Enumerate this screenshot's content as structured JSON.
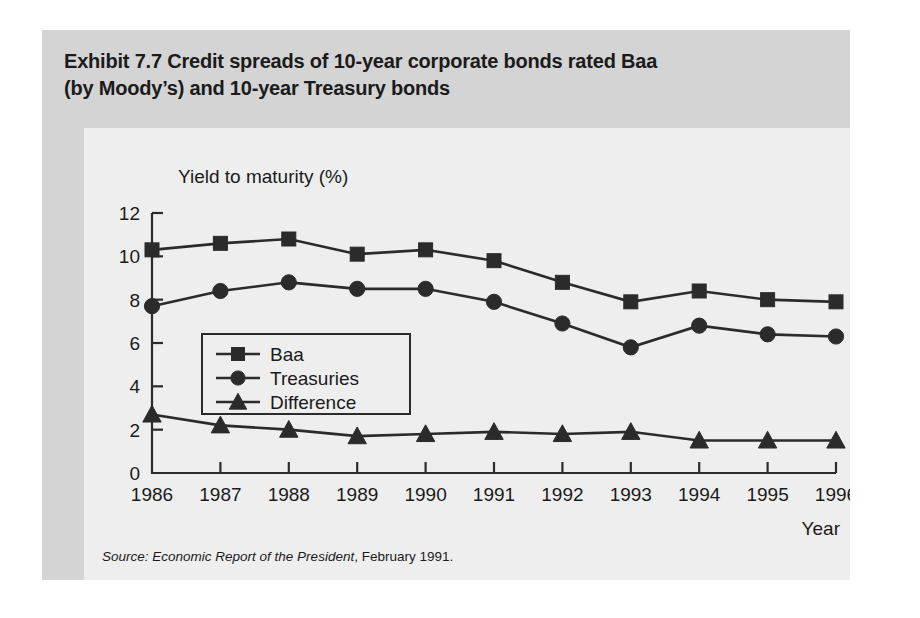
{
  "figure": {
    "title_line1": "Exhibit 7.7  Credit spreads of 10-year corporate bonds rated Baa",
    "title_line2": "(by Moody’s) and 10-year Treasury bonds",
    "source_prefix": "Source",
    "source_colon": ": ",
    "source_italic": "Economic Report of the President",
    "source_rest": ", February 1991.",
    "panel_color": "#eeeeee",
    "figure_color": "#d4d4d4",
    "ink_color": "#2b2b2b"
  },
  "chart_data": {
    "type": "line",
    "title": "Exhibit 7.7  Credit spreads of 10-year corporate bonds rated Baa (by Moody’s) and 10-year Treasury bonds",
    "xlabel": "Year",
    "ylabel": "Yield to maturity (%)",
    "categories": [
      "1986",
      "1987",
      "1988",
      "1989",
      "1990",
      "1991",
      "1992",
      "1993",
      "1994",
      "1995",
      "1996"
    ],
    "xtick_labels": [
      "1986",
      "1987",
      "1988",
      "1989",
      "1990",
      "1991",
      "1992",
      "1993",
      "1994",
      "1995",
      "1996"
    ],
    "ytick_labels": [
      "0",
      "2",
      "4",
      "6",
      "8",
      "10",
      "12"
    ],
    "ytick_values": [
      0,
      2,
      4,
      6,
      8,
      10,
      12
    ],
    "ylim": [
      0,
      12
    ],
    "grid": false,
    "legend_position": "inside-left",
    "series": [
      {
        "name": "Baa",
        "marker": "square",
        "values": [
          10.3,
          10.6,
          10.8,
          10.1,
          10.3,
          9.8,
          8.8,
          7.9,
          8.4,
          8.0,
          7.9
        ]
      },
      {
        "name": "Treasuries",
        "marker": "circle",
        "values": [
          7.7,
          8.4,
          8.8,
          8.5,
          8.5,
          7.9,
          6.9,
          5.8,
          6.8,
          6.4,
          6.3
        ]
      },
      {
        "name": "Difference",
        "marker": "triangle",
        "values": [
          2.7,
          2.2,
          2.0,
          1.7,
          1.8,
          1.9,
          1.8,
          1.9,
          1.5,
          1.5,
          1.5
        ]
      }
    ]
  }
}
